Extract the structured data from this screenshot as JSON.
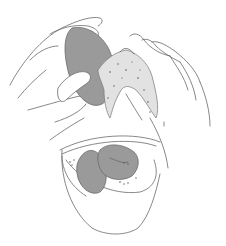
{
  "illustration": {
    "subject": "Hands squeezing a gray sponge over a bowl with soapy water and two sponges",
    "colors": {
      "background": "#ffffff",
      "line": "#6a6a6a",
      "sponge": "#9a9a9a",
      "foam": "#e2e2e2"
    }
  }
}
